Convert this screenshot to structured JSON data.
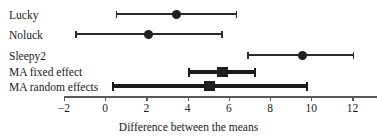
{
  "chart_data": {
    "type": "forest",
    "title": "",
    "xlabel": "Difference between the means",
    "ylabel": "",
    "xlim": [
      -2.8,
      13.2
    ],
    "xticks": [
      -2,
      0,
      2,
      4,
      6,
      8,
      10,
      12
    ],
    "xtick_labels": [
      "−2",
      "0",
      "2",
      "4",
      "6",
      "8",
      "10",
      "12"
    ],
    "grid": false,
    "legend": "none",
    "marker_colors": {
      "study_point": "#1f1f1f",
      "summary_point": "#1a1a1a",
      "line": "#2b2b2b",
      "axis": "#5a5a5a"
    },
    "rows": [
      {
        "label": "Lucky",
        "kind": "study",
        "marker": "circle",
        "estimate": 3.45,
        "ci_low": 0.5,
        "ci_high": 6.4
      },
      {
        "label": "Noluck",
        "kind": "study",
        "marker": "circle",
        "estimate": 2.1,
        "ci_low": -1.45,
        "ci_high": 5.7
      },
      {
        "label": "Sleepy2",
        "kind": "study",
        "marker": "circle",
        "estimate": 9.6,
        "ci_low": 6.9,
        "ci_high": 12.1
      },
      {
        "label": "MA fixed effect",
        "kind": "summary",
        "marker": "square",
        "estimate": 5.7,
        "ci_low": 4.0,
        "ci_high": 7.3
      },
      {
        "label": "MA random effects",
        "kind": "summary",
        "marker": "square",
        "estimate": 5.05,
        "ci_low": 0.35,
        "ci_high": 9.8
      }
    ],
    "row_y": [
      14,
      34,
      55,
      72,
      86
    ],
    "label_y": [
      9,
      29,
      50,
      66,
      81
    ]
  }
}
